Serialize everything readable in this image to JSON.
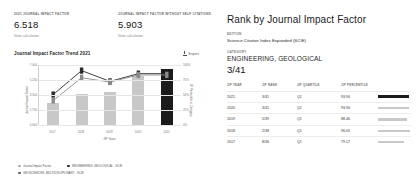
{
  "left": {
    "cards": [
      {
        "label": "2021 JOURNAL IMPACT FACTOR",
        "value": "6.518",
        "link": "View calculation"
      },
      {
        "label": "JOURNAL IMPACT FACTOR WITHOUT SELF CITATIONS",
        "value": "5.903",
        "link": "View calculation"
      }
    ],
    "trend_title": "Journal Impact Factor Trend 2021",
    "export_label": "Export"
  },
  "chart_data": {
    "type": "bar",
    "title": "Journal Impact Factor Trend 2021",
    "categories": [
      "2017",
      "2018",
      "2019",
      "2020",
      "2021"
    ],
    "series": [
      {
        "name": "Journal Impact Factor",
        "type": "bar",
        "values": [
          2.617,
          3.642,
          3.798,
          5.741,
          6.518
        ]
      },
      {
        "name": "ENGINEERING, GEOLOGICAL - SCIE",
        "type": "line",
        "values": [
          79.17,
          96.05,
          88.46,
          93.9,
          93.9
        ]
      },
      {
        "name": "GEOSCIENCES, MULTIDISCIPLINARY - SCIE",
        "type": "line",
        "values": [
          75.0,
          91.0,
          88.0,
          93.0,
          93.0
        ]
      }
    ],
    "xlabel": "JIF Years",
    "ylabel": "Journal Impact Factor",
    "y2label": "JIF Percentile in Category",
    "yticks": [
      "7.000",
      "5.250",
      "3.500",
      "1.750",
      "0.000"
    ],
    "ylim": [
      0,
      7
    ],
    "y2ticks": [
      "100%",
      "75%",
      "50%",
      "25%",
      "0%"
    ],
    "y2lim": [
      0,
      100
    ],
    "grid": true,
    "legend_position": "bottom",
    "legend": [
      "Journal Impact Factor",
      "ENGINEERING, GEOLOGICAL - SCIE",
      "GEOSCIENCES, MULTIDISCIPLINARY - SCIE"
    ]
  },
  "right": {
    "title": "Rank by Journal Impact Factor",
    "edition_label": "EDITION",
    "edition_value": "Science Citation Index Expanded (SCIE)",
    "category_label": "CATEGORY",
    "category_value": "ENGINEERING, GEOLOGICAL",
    "rank_value": "3/41",
    "columns": [
      "JIF YEAR",
      "JIF RANK",
      "JIF QUARTILE",
      "JIF PERCENTILE"
    ],
    "rows": [
      {
        "year": "2021",
        "rank": "3/41",
        "quartile": "Q1",
        "percentile": "93.90",
        "bar": 93.9,
        "current": true
      },
      {
        "year": "2020",
        "rank": "3/41",
        "quartile": "Q1",
        "percentile": "93.90",
        "bar": 93.9,
        "current": false
      },
      {
        "year": "2019",
        "rank": "5/39",
        "quartile": "Q1",
        "percentile": "88.46",
        "bar": 88.46,
        "current": false
      },
      {
        "year": "2018",
        "rank": "2/38",
        "quartile": "Q1",
        "percentile": "96.05",
        "bar": 96.05,
        "current": false
      },
      {
        "year": "2017",
        "rank": "8/36",
        "quartile": "Q1",
        "percentile": "79.17",
        "bar": 79.17,
        "current": false
      }
    ]
  }
}
